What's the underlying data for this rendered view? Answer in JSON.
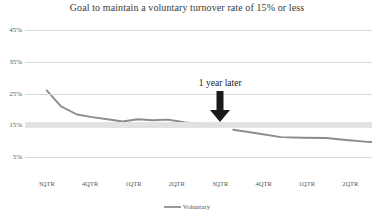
{
  "chart_data": {
    "type": "line",
    "title": "Goal to maintain a voluntary turnover rate of 15% or less",
    "xlabel": "",
    "ylabel": "",
    "ylim": [
      0,
      45
    ],
    "yticks": [
      45,
      35,
      25,
      15,
      5
    ],
    "ytick_labels": [
      "45%",
      "35%",
      "25%",
      "15%",
      "5%"
    ],
    "grid": true,
    "legend_position": "bottom",
    "categories": [
      "3QTR",
      "4QTR",
      "1QTR",
      "2QTR",
      "3QTR",
      "4QTR",
      "1QTR",
      "2QTR"
    ],
    "x": [
      0,
      1,
      2,
      3,
      4,
      5,
      6,
      7
    ],
    "series": [
      {
        "name": "Voluntary",
        "color": "#8c8c8c",
        "values": [
          26,
          18.5,
          16.8,
          16.5,
          15.2,
          13.2,
          11.2,
          9.8
        ],
        "points": [
          {
            "x": 0.0,
            "value": 26.0
          },
          {
            "x": 0.33,
            "value": 21.0
          },
          {
            "x": 0.7,
            "value": 18.4
          },
          {
            "x": 1.05,
            "value": 17.6
          },
          {
            "x": 1.4,
            "value": 16.9
          },
          {
            "x": 1.75,
            "value": 16.2
          },
          {
            "x": 2.1,
            "value": 16.9
          },
          {
            "x": 2.45,
            "value": 16.6
          },
          {
            "x": 2.8,
            "value": 16.8
          },
          {
            "x": 3.2,
            "value": 15.9
          },
          {
            "x": 3.6,
            "value": 15.4
          },
          {
            "x": 3.95,
            "value": 15.0
          },
          {
            "x": 4.3,
            "value": 13.6
          },
          {
            "x": 4.8,
            "value": 12.6
          },
          {
            "x": 5.4,
            "value": 11.3
          },
          {
            "x": 5.9,
            "value": 11.1
          },
          {
            "x": 6.45,
            "value": 11.0
          },
          {
            "x": 6.9,
            "value": 10.4
          },
          {
            "x": 7.4,
            "value": 9.8
          },
          {
            "x": 8.0,
            "value": 9.7
          }
        ],
        "break_after_x": 3.95
      }
    ],
    "goal_band": {
      "label": "15% goal",
      "lower": 14.2,
      "upper": 16.0,
      "color": "#e2e2e2"
    },
    "annotations": [
      {
        "text": "1 year later",
        "x": 4.0,
        "y": 27.0,
        "arrow": "down",
        "arrow_color": "#1a1a1a"
      }
    ]
  },
  "legend": {
    "entries": [
      {
        "label": "Voluntary",
        "color": "#8c8c8c"
      }
    ]
  }
}
